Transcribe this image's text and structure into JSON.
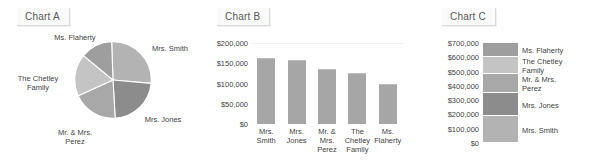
{
  "charts": {
    "a": {
      "title": "Chart A"
    },
    "b": {
      "title": "Chart B"
    },
    "c": {
      "title": "Chart C"
    }
  },
  "labels": {
    "smith": "Mrs. Smith",
    "jones": "Mrs. Jones",
    "perez_2line": "Mr. & Mrs.\nPerez",
    "chetley_2line": "The Chetley\nFamily",
    "flaherty": "Ms. Flaherty",
    "smith_2line": "Mrs.\nSmith",
    "jones_2line": "Mrs.\nJones",
    "perez_3line": "Mr. &\nMrs.\nPerez",
    "chetley_b": "The\nChetley\nFamily",
    "flaherty_2line": "Ms.\nFlaherty"
  },
  "colors": {
    "smith": "#b3b3b3",
    "jones": "#8c8c8c",
    "perez": "#a8a8a8",
    "chetley": "#c4c4c4",
    "flaherty": "#9e9e9e",
    "bar_fill": "#a6a6a6",
    "title_text": "#595959",
    "axis_text": "#444444"
  },
  "chart_data": [
    {
      "type": "pie",
      "title": "Chart A",
      "legend_position": "outside-labels",
      "categories": [
        "Mrs. Smith",
        "Mrs. Jones",
        "Mr. & Mrs. Perez",
        "The Chetley Family",
        "Ms. Flaherty"
      ],
      "values": [
        190000,
        160000,
        135000,
        125000,
        95000
      ],
      "percentages": [
        27.1,
        22.9,
        19.3,
        17.9,
        13.6
      ],
      "colors": [
        "#b3b3b3",
        "#8c8c8c",
        "#a8a8a8",
        "#c4c4c4",
        "#9e9e9e"
      ]
    },
    {
      "type": "bar",
      "title": "Chart B",
      "categories": [
        "Mrs. Smith",
        "Mrs. Jones",
        "Mr. & Mrs. Perez",
        "The Chetley Family",
        "Ms. Flaherty"
      ],
      "values": [
        163000,
        158000,
        136000,
        125000,
        98000
      ],
      "xlabel": "",
      "ylabel": "",
      "ylim": [
        0,
        200000
      ],
      "yticks": [
        0,
        50000,
        100000,
        150000,
        200000
      ],
      "ytick_labels": [
        "$0",
        "$50,000",
        "$100,000",
        "$150,000",
        "$200,000"
      ],
      "grid": true,
      "legend_position": "none"
    },
    {
      "type": "bar",
      "subtype": "stacked-single-column",
      "title": "Chart C",
      "categories": [
        "Total"
      ],
      "series": [
        {
          "name": "Mrs. Smith",
          "values": [
            190000
          ]
        },
        {
          "name": "Mrs. Jones",
          "values": [
            160000
          ]
        },
        {
          "name": "Mr. & Mrs. Perez",
          "values": [
            135000
          ]
        },
        {
          "name": "The Chetley Family",
          "values": [
            125000
          ]
        },
        {
          "name": "Ms. Flaherty",
          "values": [
            95000
          ]
        }
      ],
      "ylim": [
        0,
        700000
      ],
      "yticks": [
        0,
        100000,
        200000,
        300000,
        400000,
        500000,
        600000,
        700000
      ],
      "ytick_labels": [
        "$0",
        "$100,000",
        "$200,000",
        "$300,000",
        "$400,000",
        "$500,000",
        "$600,000",
        "$700,000"
      ],
      "legend_position": "right",
      "grid": false
    }
  ]
}
